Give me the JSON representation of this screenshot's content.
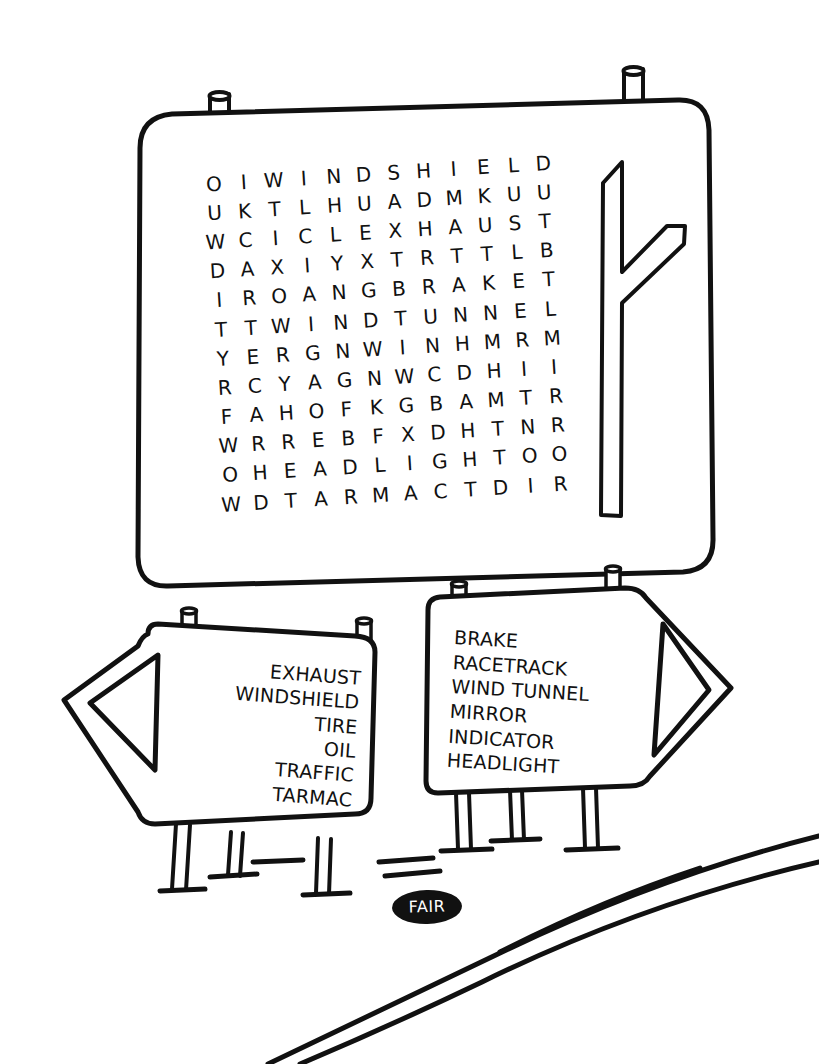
{
  "puzzle": {
    "title": "Car / Motoring Word Search",
    "grid": {
      "rows": 12,
      "cols": 12,
      "letters": [
        [
          "O",
          "I",
          "W",
          "I",
          "N",
          "D",
          "S",
          "H",
          "I",
          "E",
          "L",
          "D"
        ],
        [
          "U",
          "K",
          "T",
          "L",
          "H",
          "U",
          "A",
          "D",
          "M",
          "K",
          "U",
          "U"
        ],
        [
          "W",
          "C",
          "I",
          "C",
          "L",
          "E",
          "X",
          "H",
          "A",
          "U",
          "S",
          "T"
        ],
        [
          "D",
          "A",
          "X",
          "I",
          "Y",
          "X",
          "T",
          "R",
          "T",
          "T",
          "L",
          "B"
        ],
        [
          "I",
          "R",
          "O",
          "A",
          "N",
          "G",
          "B",
          "R",
          "A",
          "K",
          "E",
          "T"
        ],
        [
          "T",
          "T",
          "W",
          "I",
          "N",
          "D",
          "T",
          "U",
          "N",
          "N",
          "E",
          "L"
        ],
        [
          "Y",
          "E",
          "R",
          "G",
          "N",
          "W",
          "I",
          "N",
          "H",
          "M",
          "R",
          "M"
        ],
        [
          "R",
          "C",
          "Y",
          "A",
          "G",
          "N",
          "W",
          "C",
          "D",
          "H",
          "I",
          "I"
        ],
        [
          "F",
          "A",
          "H",
          "O",
          "F",
          "K",
          "G",
          "B",
          "A",
          "M",
          "T",
          "R"
        ],
        [
          "W",
          "R",
          "R",
          "E",
          "B",
          "F",
          "X",
          "D",
          "H",
          "T",
          "N",
          "R"
        ],
        [
          "O",
          "H",
          "E",
          "A",
          "D",
          "L",
          "I",
          "G",
          "H",
          "T",
          "O",
          "O"
        ],
        [
          "W",
          "D",
          "T",
          "A",
          "R",
          "M",
          "A",
          "C",
          "T",
          "D",
          "I",
          "R"
        ]
      ]
    },
    "left_sign": {
      "words": [
        "EXHAUST",
        "WINDSHIELD",
        "TIRE",
        "OIL",
        "TRAFFIC",
        "TARMAC"
      ],
      "arrow_direction": "left"
    },
    "right_sign": {
      "words": [
        "BRAKE",
        "RACETRACK",
        "WIND TUNNEL",
        "MIRROR",
        "INDICATOR",
        "HEADLIGHT"
      ],
      "arrow_direction": "right"
    },
    "badge": {
      "label": "FAIR"
    },
    "icons": {
      "fork_road": "fork-road-icon",
      "left_arrow": "left-arrow-icon",
      "right_arrow": "right-arrow-icon"
    },
    "colors": {
      "ink": "#111111",
      "paper": "#ffffff",
      "badge_fill": "#111111",
      "badge_text": "#ffffff"
    }
  }
}
